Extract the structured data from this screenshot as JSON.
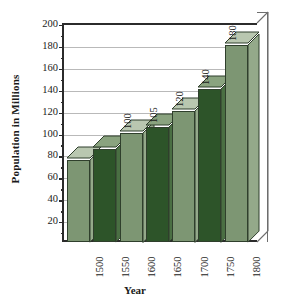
{
  "chart_data": {
    "type": "bar",
    "title": "",
    "xlabel": "Year",
    "ylabel": "Population in Millions",
    "categories": [
      "1500",
      "1550",
      "1600",
      "1650",
      "1700",
      "1750",
      "1800"
    ],
    "values": [
      75,
      85,
      100,
      105,
      120,
      140,
      180
    ],
    "data_labels": [
      "",
      "",
      "100",
      "105",
      "120",
      "140",
      "180"
    ],
    "ylim": [
      0,
      200
    ],
    "ytick_step": 20,
    "yticks": [
      20,
      40,
      60,
      80,
      100,
      120,
      140,
      160,
      180,
      200
    ],
    "grid": true,
    "legend": false,
    "style": "3d-column",
    "colors": {
      "bar_light": "#7d9673",
      "bar_dark": "#2d5429",
      "bar_light_top": "#b9c7b0",
      "bar_dark_top": "#8aa37f",
      "bar_light_side": "#94a98a",
      "bar_dark_side": "#4a6f43",
      "axis": "#2b2b2b",
      "grid": "#b9b9b9",
      "text": "#1a1a1a",
      "background": "#ffffff"
    },
    "bar_shades": [
      "light",
      "dark",
      "light",
      "dark",
      "light",
      "dark",
      "light"
    ]
  }
}
